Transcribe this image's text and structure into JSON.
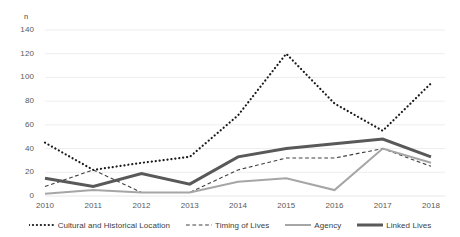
{
  "chart_data": {
    "type": "line",
    "title": "",
    "xlabel": "",
    "ylabel": "n",
    "ylim": [
      0,
      140
    ],
    "ytick_step": 20,
    "yticks": [
      0,
      20,
      40,
      60,
      80,
      100,
      120,
      140
    ],
    "grid": true,
    "grid_axis": "y",
    "legend_position": "bottom",
    "categories": [
      2010,
      2011,
      2012,
      2013,
      2014,
      2015,
      2016,
      2017,
      2018
    ],
    "xtick_labels": [
      "2010",
      "2011",
      "2012",
      "2013",
      "2014",
      "2015",
      "2016",
      "2017",
      "2018"
    ],
    "series": [
      {
        "name": "Cultural and Historical Location",
        "style": "dotted",
        "color": "#1a1a1a",
        "width": 2.2,
        "values": [
          45,
          22,
          28,
          33,
          68,
          120,
          78,
          55,
          95
        ]
      },
      {
        "name": "Timing of Lives",
        "style": "dashed",
        "color": "#404040",
        "width": 1.1,
        "values": [
          8,
          22,
          3,
          3,
          22,
          32,
          32,
          40,
          25
        ]
      },
      {
        "name": "Agency",
        "style": "solid",
        "color": "#a6a6a6",
        "width": 2.0,
        "values": [
          2,
          5,
          3,
          3,
          12,
          15,
          5,
          40,
          28
        ]
      },
      {
        "name": "Linked Lives",
        "style": "solid",
        "color": "#595959",
        "width": 3.0,
        "values": [
          15,
          8,
          19,
          10,
          33,
          40,
          44,
          48,
          33
        ]
      }
    ]
  },
  "axis": {
    "unit_label": "n"
  },
  "colors": {
    "background": "#ffffff",
    "gridline": "#e8e8e8",
    "tick_text": "#595959",
    "legend_text": "#404040"
  }
}
